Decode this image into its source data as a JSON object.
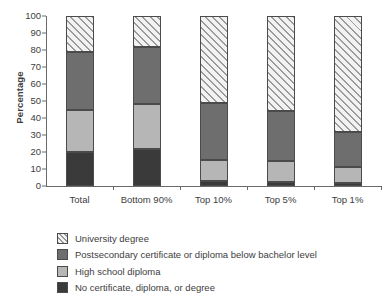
{
  "chart_data": {
    "type": "bar",
    "subtype": "stacked-bar-100",
    "title": "",
    "xlabel": "",
    "ylabel": "Percentage",
    "ylim": [
      0,
      100
    ],
    "yticks": [
      0,
      10,
      20,
      30,
      40,
      50,
      60,
      70,
      80,
      90,
      100
    ],
    "ytick_labels": [
      "0",
      "10",
      "20",
      "30",
      "40",
      "50",
      "60",
      "70",
      "80",
      "90",
      "100"
    ],
    "grid": false,
    "legend_position": "below-axes-left",
    "categories": [
      "Total",
      "Bottom 90%",
      "Top 10%",
      "Top 5%",
      "Top 1%"
    ],
    "series": [
      {
        "name": "No certificate, diploma, or degree",
        "color": "#3a3a3a",
        "pattern": "solid",
        "values": [
          20.0,
          21.5,
          3.0,
          2.5,
          1.5
        ]
      },
      {
        "name": "High school diploma",
        "color": "#b6b6b6",
        "pattern": "solid",
        "values": [
          25.0,
          27.0,
          12.5,
          12.0,
          9.5
        ]
      },
      {
        "name": "Postsecondary certificate or diploma below bachelor level",
        "color": "#6e6e6e",
        "pattern": "solid",
        "values": [
          34.0,
          33.0,
          33.5,
          29.5,
          21.0
        ]
      },
      {
        "name": "University degree",
        "color": "#f2f2f2",
        "pattern": "diagonal-hatch",
        "values": [
          21.0,
          18.5,
          51.0,
          56.0,
          68.0
        ]
      }
    ],
    "cumulative_tops": {
      "Total": [
        20.0,
        45.0,
        79.0,
        100.0
      ],
      "Bottom 90%": [
        21.5,
        48.5,
        81.5,
        100.0
      ],
      "Top 10%": [
        3.0,
        15.5,
        49.0,
        100.0
      ],
      "Top 5%": [
        2.5,
        14.5,
        44.0,
        100.0
      ],
      "Top 1%": [
        1.5,
        11.0,
        32.0,
        100.0
      ]
    }
  },
  "legend": {
    "items": [
      {
        "label": "University degree",
        "swatch": "s-univ"
      },
      {
        "label": "Postsecondary certificate or diploma below bachelor level",
        "swatch": "s-post"
      },
      {
        "label": "High school diploma",
        "swatch": "s-high"
      },
      {
        "label": "No certificate, diploma, or degree",
        "swatch": "s-none"
      }
    ]
  }
}
